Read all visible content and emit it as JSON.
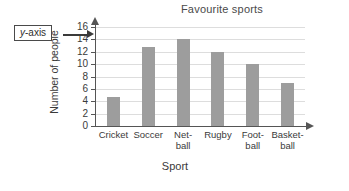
{
  "callout": {
    "label_italic": "y",
    "label_rest": "-axis",
    "name": "y-axis"
  },
  "chart_data": {
    "type": "bar",
    "title": "Favourite sports",
    "xlabel": "Sport",
    "ylabel": "Number of people",
    "categories": [
      "Cricket",
      "Soccer",
      "Netball",
      "Rugby",
      "Football",
      "Basketball"
    ],
    "category_lines": [
      [
        "Cricket"
      ],
      [
        "Soccer"
      ],
      [
        "Net-",
        "ball"
      ],
      [
        "Rugby"
      ],
      [
        "Foot-",
        "ball"
      ],
      [
        "Basket-",
        "ball"
      ]
    ],
    "values": [
      4.7,
      12.8,
      14,
      12,
      10,
      7
    ],
    "ylim": [
      0,
      16
    ],
    "ytick_step": 2,
    "yticks": [
      0,
      2,
      4,
      6,
      8,
      10,
      12,
      14,
      16
    ],
    "grid": true,
    "legend": false,
    "bar_color": "#9d9d9d",
    "grid_color": "#dddddd",
    "axis_color": "#555555"
  }
}
